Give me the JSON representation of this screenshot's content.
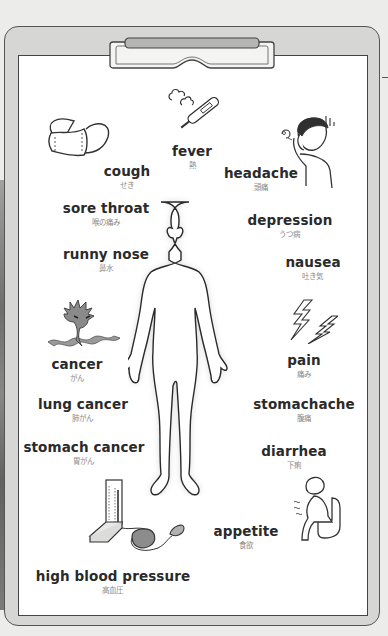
{
  "poster": {
    "subject": "symptoms and illnesses",
    "colors": {
      "board": "#d6d6d4",
      "sheet": "#ffffff",
      "outline": "#333333",
      "term_text": "#2a2a2a",
      "japanese_text": "#8a8a8a",
      "illustration_gray": "#8c8c8c"
    }
  },
  "terms": [
    {
      "id": "fever",
      "en": "fever",
      "jp": "熱",
      "icon": "thermometer-icon"
    },
    {
      "id": "cough",
      "en": "cough",
      "jp": "せき",
      "icon": "face-mask-icon"
    },
    {
      "id": "headache",
      "en": "headache",
      "jp": "頭痛",
      "icon": "person-holding-head-icon"
    },
    {
      "id": "sore-throat",
      "en": "sore throat",
      "jp": "喉の痛み"
    },
    {
      "id": "depression",
      "en": "depression",
      "jp": "うつ病"
    },
    {
      "id": "runny-nose",
      "en": "runny nose",
      "jp": "鼻水"
    },
    {
      "id": "nausea",
      "en": "nausea",
      "jp": "吐き気"
    },
    {
      "id": "cancer",
      "en": "cancer",
      "jp": "がん",
      "icon": "cancer-monster-icon"
    },
    {
      "id": "pain",
      "en": "pain",
      "jp": "痛み",
      "icon": "lightning-bolts-icon"
    },
    {
      "id": "lung-cancer",
      "en": "lung cancer",
      "jp": "肺がん"
    },
    {
      "id": "stomachache",
      "en": "stomachache",
      "jp": "腹痛"
    },
    {
      "id": "stomach-cancer",
      "en": "stomach cancer",
      "jp": "胃がん"
    },
    {
      "id": "diarrhea",
      "en": "diarrhea",
      "jp": "下痢",
      "icon": "person-on-toilet-icon"
    },
    {
      "id": "appetite",
      "en": "appetite",
      "jp": "食欲"
    },
    {
      "id": "high-blood-pressure",
      "en": "high blood pressure",
      "jp": "高血圧",
      "icon": "sphygmomanometer-icon"
    }
  ]
}
